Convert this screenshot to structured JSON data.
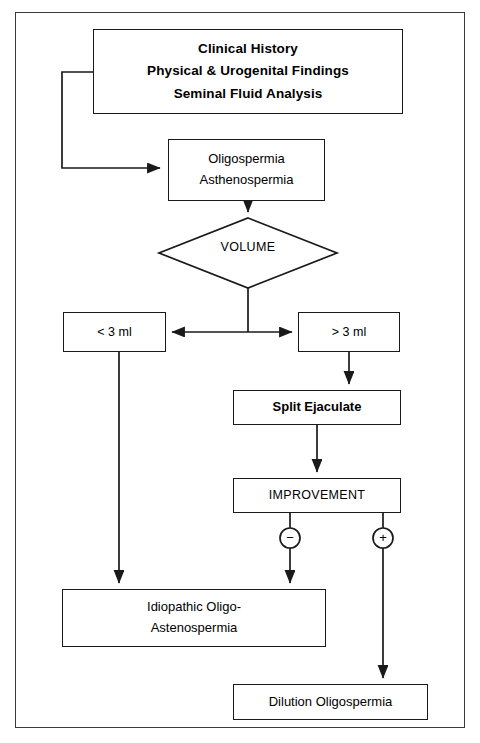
{
  "diagram": {
    "line_color": "#1a1a1a",
    "background": "#ffffff",
    "nodes": {
      "header": {
        "line1": "Clinical History",
        "line2": "Physical & Urogenital Findings",
        "line3": "Seminal Fluid Analysis"
      },
      "oligo": {
        "line1": "Oligospermia",
        "line2": "Asthenospermia"
      },
      "volume": {
        "label": "VOLUME"
      },
      "lt3": {
        "label": "< 3 ml"
      },
      "gt3": {
        "label": "> 3 ml"
      },
      "split": {
        "label": "Split Ejaculate"
      },
      "improvement": {
        "label": "IMPROVEMENT"
      },
      "idiopathic": {
        "line1": "Idiopathic Oligo-",
        "line2": "Astenospermia"
      },
      "dilution": {
        "label": "Dilution Oligospermia"
      }
    },
    "markers": {
      "negative": "−",
      "positive": "+"
    }
  }
}
